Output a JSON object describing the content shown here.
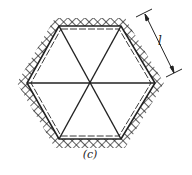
{
  "figure": {
    "caption": "(c)",
    "dimension_label": "l",
    "colors": {
      "line": "#222222",
      "background": "#ffffff"
    }
  }
}
